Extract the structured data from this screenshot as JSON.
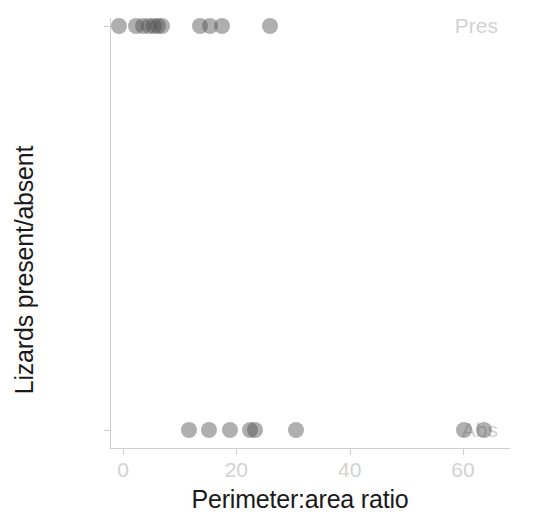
{
  "chart_data": {
    "type": "scatter",
    "title": "",
    "xlabel": "Perimeter:area ratio",
    "ylabel": "Lizards present/absent",
    "xlim": [
      -3,
      68
    ],
    "xticks": [
      0,
      20,
      40,
      60
    ],
    "xticklabels": [
      "0",
      "20",
      "40",
      "60"
    ],
    "yticks": [
      "Abs",
      "Pres"
    ],
    "yticklabels": [
      "Abs",
      "Pres"
    ],
    "grid": false,
    "legend": null,
    "point_style": {
      "color": "#4d4d4d",
      "opacity": 0.45,
      "radius_px": 8,
      "marker": "circle"
    },
    "series": [
      {
        "name": "Pres",
        "y_category": "Pres",
        "x_values": [
          -0.7,
          2.3,
          3.6,
          4.6,
          5.4,
          6.2,
          6.9,
          13.6,
          15.3,
          17.5,
          25.9
        ]
      },
      {
        "name": "Abs",
        "y_category": "Abs",
        "x_values": [
          11.6,
          15.2,
          18.8,
          22.4,
          23.3,
          30.5,
          60.2,
          63.7
        ]
      }
    ],
    "axis_color": "#cfcfcf",
    "tick_label_color": "#d2d2d2",
    "axis_title_color": "#1a1a1a"
  },
  "axes": {
    "x_title": "Perimeter:area ratio",
    "y_title": "Lizards present/absent",
    "x_ticks": [
      {
        "label": "0",
        "value": 0
      },
      {
        "label": "20",
        "value": 20
      },
      {
        "label": "40",
        "value": 40
      },
      {
        "label": "60",
        "value": 60
      }
    ],
    "y_ticks": [
      {
        "label": "Pres",
        "value": "Pres"
      },
      {
        "label": "Abs",
        "value": "Abs"
      }
    ]
  }
}
